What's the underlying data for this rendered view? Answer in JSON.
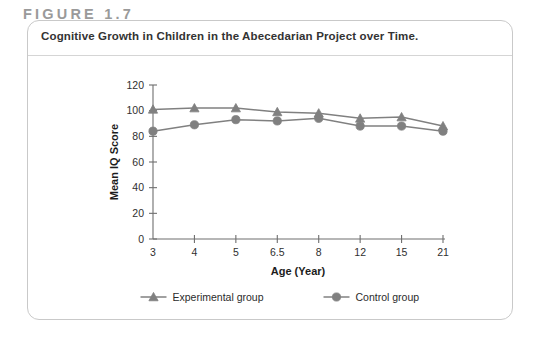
{
  "figure": {
    "label": "FIGURE 1.7",
    "title": "Cognitive Growth in Children in the Abecedarian Project over Time.",
    "copyright": "© Cengage Learning 2015"
  },
  "chart_data": {
    "type": "line",
    "title": "Cognitive Growth in Children in the Abecedarian Project over Time.",
    "xlabel": "Age (Year)",
    "ylabel": "Mean IQ Score",
    "categories": [
      "3",
      "4",
      "5",
      "6.5",
      "8",
      "12",
      "15",
      "21"
    ],
    "xticks": [
      "3",
      "4",
      "5",
      "6.5",
      "8",
      "12",
      "15",
      "21"
    ],
    "yticks": [
      "0",
      "20",
      "40",
      "60",
      "80",
      "100",
      "120"
    ],
    "ylim": [
      0,
      120
    ],
    "grid": false,
    "legend_position": "bottom",
    "series": [
      {
        "name": "Experimental group",
        "marker": "triangle",
        "color": "#808080",
        "values": [
          101,
          102,
          102,
          99,
          98,
          94,
          95,
          88
        ]
      },
      {
        "name": "Control group",
        "marker": "circle",
        "color": "#808080",
        "values": [
          84,
          89,
          93,
          92,
          94,
          88,
          88,
          84
        ]
      }
    ]
  },
  "colors": {
    "axis": "#6e6e6e",
    "series_gray": "#808080",
    "card_border": "#c9c9c9",
    "figure_label": "#9a9a9a"
  }
}
